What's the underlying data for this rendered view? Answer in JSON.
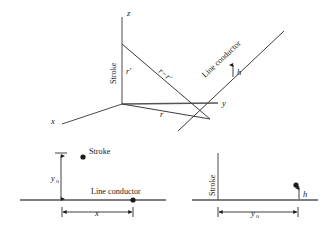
{
  "figure": {
    "colors": {
      "line": "#3b3b3b",
      "thick_line": "#555555",
      "text": "#1a1a1a",
      "background": "#ffffff"
    },
    "top_diagram": {
      "name": "3d-perspective-view",
      "axes": [
        {
          "id": "x",
          "label": "x"
        },
        {
          "id": "y",
          "label": "y"
        },
        {
          "id": "z",
          "label": "z"
        }
      ],
      "labels": {
        "stroke": "Stroke",
        "line_conductor": "Line conductor",
        "r_prime": "r′",
        "r": "r",
        "r_minus_r_prime": "r−r′",
        "height": "h"
      }
    },
    "bottom_left_diagram": {
      "name": "side-view-left",
      "labels": {
        "stroke": "Stroke",
        "line_conductor": "Line conductor",
        "y0_base": "y",
        "y0_sub": "o",
        "x": "x"
      }
    },
    "bottom_right_diagram": {
      "name": "side-view-right",
      "labels": {
        "stroke": "Stroke",
        "height": "h",
        "y0_base": "y",
        "y0_sub": "o"
      }
    }
  }
}
